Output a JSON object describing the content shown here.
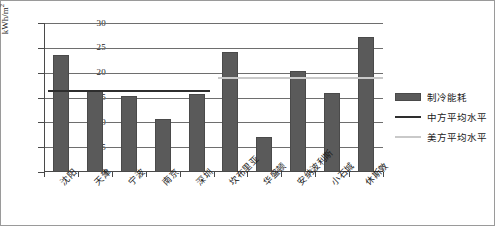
{
  "chart_data": {
    "type": "bar",
    "title": "",
    "xlabel": "",
    "ylabel": "kWh/m2",
    "ylabel_unit_super": "2",
    "ylim": [
      0,
      30
    ],
    "yticks": [
      0,
      5,
      10,
      15,
      20,
      25,
      30
    ],
    "grid": true,
    "legend_position": "right-outside",
    "categories": [
      "沈阳",
      "天津",
      "宁波",
      "南京",
      "深圳",
      "坎布里亚",
      "华盛顿",
      "安纳波利斯",
      "小石城",
      "休斯敦"
    ],
    "series": [
      {
        "name": "制冷能耗",
        "type": "bar",
        "color": "#5a5a5a",
        "values": [
          23.6,
          16.3,
          15.4,
          10.6,
          15.8,
          24.2,
          7.0,
          20.4,
          16.0,
          27.2
        ]
      },
      {
        "name": "中方平均水平",
        "type": "reference-line",
        "color": "#2e2e2e",
        "value": 16.5,
        "spans_categories": [
          "沈阳",
          "天津",
          "宁波",
          "南京",
          "深圳"
        ]
      },
      {
        "name": "美方平均水平",
        "type": "reference-line",
        "color": "#c9c9c9",
        "value": 19.1,
        "spans_categories": [
          "坎布里亚",
          "华盛顿",
          "安纳波利斯",
          "小石城",
          "休斯敦"
        ]
      }
    ]
  },
  "legend": {
    "items": [
      {
        "label": "制冷能耗",
        "key": "bar-swatch"
      },
      {
        "label": "中方平均水平",
        "key": "line-swatch-dark"
      },
      {
        "label": "美方平均水平",
        "key": "line-swatch-light"
      }
    ]
  }
}
